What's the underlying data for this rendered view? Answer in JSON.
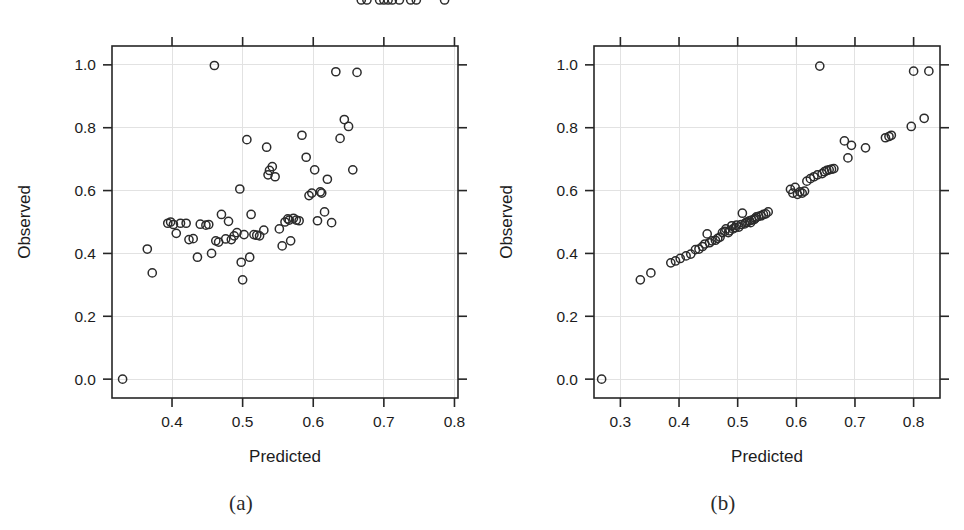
{
  "figure": {
    "title": "",
    "panels": [
      {
        "id": "a",
        "caption": "(a)",
        "xlabel": "Predicted",
        "ylabel": "Observed"
      },
      {
        "id": "b",
        "caption": "(b)",
        "xlabel": "Predicted",
        "ylabel": "Observed"
      }
    ],
    "colors": {
      "point_stroke": "#2b2b2b",
      "axis": "#262626",
      "grid": "#e2e2e2",
      "background": "#ffffff"
    }
  },
  "chart_data": [
    {
      "type": "scatter",
      "panel": "a",
      "title": "(a)",
      "xlabel": "Predicted",
      "ylabel": "Observed",
      "xlim": [
        0.315,
        0.805
      ],
      "ylim": [
        -0.06,
        1.06
      ],
      "xticks": [
        0.4,
        0.5,
        0.6,
        0.7,
        0.8
      ],
      "yticks": [
        0.0,
        0.2,
        0.4,
        0.6,
        0.8,
        1.0
      ],
      "xticklabels": [
        "0.4",
        "0.5",
        "0.6",
        "0.7",
        "0.8"
      ],
      "yticklabels": [
        "0.0",
        "0.2",
        "0.4",
        "0.6",
        "0.8",
        "1.0"
      ],
      "grid": true,
      "legend": null,
      "marker": "open-circle",
      "n_points": 73,
      "x": [
        0.33,
        0.365,
        0.372,
        0.394,
        0.398,
        0.402,
        0.406,
        0.412,
        0.42,
        0.424,
        0.43,
        0.436,
        0.44,
        0.448,
        0.452,
        0.456,
        0.46,
        0.462,
        0.466,
        0.47,
        0.476,
        0.48,
        0.484,
        0.488,
        0.492,
        0.496,
        0.498,
        0.5,
        0.502,
        0.506,
        0.51,
        0.512,
        0.516,
        0.52,
        0.524,
        0.53,
        0.534,
        0.536,
        0.538,
        0.542,
        0.546,
        0.552,
        0.556,
        0.56,
        0.564,
        0.566,
        0.568,
        0.572,
        0.576,
        0.58,
        0.584,
        0.59,
        0.594,
        0.598,
        0.602,
        0.606,
        0.61,
        0.612,
        0.616,
        0.62,
        0.626,
        0.632,
        0.638,
        0.644,
        0.65,
        0.656,
        0.662,
        0.668,
        0.676,
        0.694,
        0.7,
        0.706,
        0.712,
        0.722,
        0.738,
        0.746,
        0.786
      ],
      "y": [
        0.0,
        0.414,
        0.338,
        0.496,
        0.5,
        0.492,
        0.464,
        0.496,
        0.496,
        0.444,
        0.447,
        0.388,
        0.493,
        0.49,
        0.492,
        0.4,
        0.998,
        0.44,
        0.436,
        0.524,
        0.446,
        0.502,
        0.444,
        0.456,
        0.466,
        0.605,
        0.372,
        0.316,
        0.46,
        0.762,
        0.388,
        0.524,
        0.46,
        0.458,
        0.456,
        0.474,
        0.738,
        0.65,
        0.664,
        0.676,
        0.644,
        0.478,
        0.424,
        0.5,
        0.51,
        0.506,
        0.44,
        0.512,
        0.506,
        0.504,
        0.776,
        0.706,
        0.584,
        0.592,
        0.666,
        0.504,
        0.596,
        0.592,
        0.532,
        0.636,
        0.498,
        0.978,
        0.766,
        0.826,
        0.804,
        0.666,
        0.976
      ],
      "notes": "Weakly correlated cloud; dense band near Observed 0.40-0.55. Outlier at (0.33, 0.00) and high points near Observed 1.0."
    },
    {
      "type": "scatter",
      "panel": "b",
      "title": "(b)",
      "xlabel": "Predicted",
      "ylabel": "Observed",
      "xlim": [
        0.255,
        0.845
      ],
      "ylim": [
        -0.06,
        1.06
      ],
      "xticks": [
        0.3,
        0.4,
        0.5,
        0.6,
        0.7,
        0.8
      ],
      "yticks": [
        0.0,
        0.2,
        0.4,
        0.6,
        0.8,
        1.0
      ],
      "xticklabels": [
        "0.3",
        "0.4",
        "0.5",
        "0.6",
        "0.7",
        "0.8"
      ],
      "yticklabels": [
        "0.0",
        "0.2",
        "0.4",
        "0.6",
        "0.8",
        "1.0"
      ],
      "grid": true,
      "legend": null,
      "marker": "open-circle",
      "n_points": 73,
      "x": [
        0.268,
        0.334,
        0.352,
        0.386,
        0.394,
        0.402,
        0.412,
        0.42,
        0.428,
        0.434,
        0.44,
        0.444,
        0.448,
        0.452,
        0.456,
        0.462,
        0.466,
        0.47,
        0.474,
        0.478,
        0.48,
        0.484,
        0.486,
        0.49,
        0.492,
        0.496,
        0.498,
        0.502,
        0.506,
        0.508,
        0.512,
        0.514,
        0.516,
        0.52,
        0.522,
        0.524,
        0.528,
        0.53,
        0.532,
        0.536,
        0.54,
        0.544,
        0.548,
        0.552,
        0.59,
        0.594,
        0.598,
        0.602,
        0.606,
        0.61,
        0.614,
        0.618,
        0.624,
        0.63,
        0.636,
        0.64,
        0.644,
        0.648,
        0.652,
        0.656,
        0.66,
        0.664,
        0.682,
        0.688,
        0.694,
        0.718,
        0.752,
        0.758,
        0.762,
        0.796,
        0.8,
        0.818,
        0.826
      ],
      "y": [
        0.0,
        0.316,
        0.338,
        0.37,
        0.376,
        0.384,
        0.392,
        0.398,
        0.412,
        0.414,
        0.422,
        0.43,
        0.462,
        0.434,
        0.44,
        0.442,
        0.448,
        0.452,
        0.466,
        0.47,
        0.478,
        0.466,
        0.472,
        0.488,
        0.478,
        0.482,
        0.49,
        0.484,
        0.492,
        0.528,
        0.494,
        0.498,
        0.5,
        0.504,
        0.498,
        0.506,
        0.508,
        0.512,
        0.516,
        0.518,
        0.52,
        0.524,
        0.526,
        0.532,
        0.604,
        0.592,
        0.61,
        0.588,
        0.596,
        0.592,
        0.598,
        0.63,
        0.638,
        0.644,
        0.65,
        0.996,
        0.654,
        0.66,
        0.664,
        0.666,
        0.668,
        0.67,
        0.758,
        0.704,
        0.744,
        0.736,
        0.768,
        0.772,
        0.776,
        0.804,
        0.98,
        0.83,
        0.98
      ],
      "notes": "Tight near-linear relation along identity-like trend. Outlier at (0.27, 0.00); three points near Observed 1.0 at Predicted 0.64, 0.80, 0.83."
    }
  ]
}
